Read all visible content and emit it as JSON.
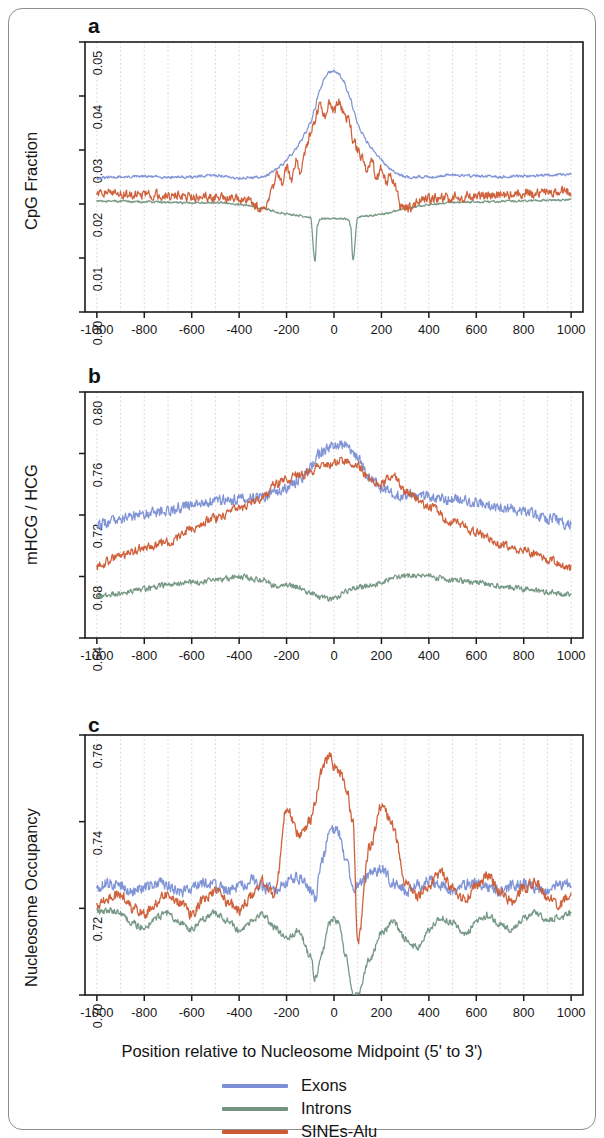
{
  "figure": {
    "border_color": "#8e8e8e",
    "background": "#ffffff"
  },
  "colors": {
    "exons": "#7a8fd4",
    "introns": "#71937f",
    "sines_alu": "#cc5a33",
    "axis": "#1a1a1a",
    "grid": "#c9c9c9"
  },
  "xaxis": {
    "title": "Position relative to Nucleosome Midpoint (5' to 3')",
    "ticks": [
      -1000,
      -800,
      -600,
      -400,
      -200,
      0,
      200,
      400,
      600,
      800,
      1000
    ],
    "tick_labels": [
      "-1000",
      "-800",
      "-600",
      "-400",
      "-200",
      "0",
      "200",
      "400",
      "600",
      "800",
      "1000"
    ],
    "min": -1050,
    "max": 1050
  },
  "legend": {
    "position": "bottom-center",
    "items": [
      {
        "label": "Exons",
        "color": "#7a8fd4",
        "key": "exons"
      },
      {
        "label": "Introns",
        "color": "#71937f",
        "key": "introns"
      },
      {
        "label": "SINEs-Alu",
        "color": "#cc5a33",
        "key": "sines_alu"
      }
    ]
  },
  "panels": [
    {
      "letter": "a",
      "ylabel": "CpG Fraction",
      "ytick_labels": [
        "0.00",
        "0.01",
        "0.02",
        "0.03",
        "0.04",
        "0.05"
      ],
      "yticks": [
        0.0,
        0.01,
        0.02,
        0.03,
        0.04,
        0.05
      ],
      "ylim": [
        0.0,
        0.05
      ]
    },
    {
      "letter": "b",
      "ylabel": "mHCG / HCG",
      "ytick_labels": [
        "0.64",
        "0.68",
        "0.72",
        "0.76",
        "0.80"
      ],
      "yticks": [
        0.64,
        0.68,
        0.72,
        0.76,
        0.8
      ],
      "ylim": [
        0.64,
        0.8
      ]
    },
    {
      "letter": "c",
      "ylabel": "Nucleosome Occupancy",
      "ytick_labels": [
        "0.70",
        "0.72",
        "0.74",
        "0.76"
      ],
      "yticks": [
        0.7,
        0.72,
        0.74,
        0.76
      ],
      "ylim": [
        0.7,
        0.76
      ]
    }
  ],
  "chart_data": [
    {
      "type": "line",
      "panel": "a",
      "title": "CpG Fraction",
      "xlabel": "Position relative to Nucleosome Midpoint (5' to 3')",
      "ylabel": "CpG Fraction",
      "xlim": [
        -1050,
        1050
      ],
      "ylim": [
        0.0,
        0.05
      ],
      "grid": true,
      "x": [
        -1000,
        -900,
        -800,
        -700,
        -600,
        -500,
        -400,
        -300,
        -280,
        -260,
        -240,
        -220,
        -200,
        -180,
        -160,
        -140,
        -120,
        -100,
        -80,
        -70,
        -60,
        -40,
        -20,
        0,
        20,
        40,
        60,
        70,
        80,
        100,
        120,
        140,
        160,
        180,
        200,
        220,
        240,
        260,
        280,
        300,
        400,
        500,
        600,
        700,
        800,
        900,
        1000
      ],
      "series": [
        {
          "name": "Exons",
          "color": "#7a8fd4",
          "values": [
            0.0248,
            0.025,
            0.0251,
            0.025,
            0.025,
            0.0253,
            0.0248,
            0.025,
            0.0254,
            0.0259,
            0.0265,
            0.0272,
            0.0281,
            0.0292,
            0.0303,
            0.0316,
            0.0331,
            0.035,
            0.0378,
            0.0396,
            0.0411,
            0.0432,
            0.0444,
            0.0447,
            0.044,
            0.0428,
            0.0406,
            0.0394,
            0.0377,
            0.0349,
            0.033,
            0.0315,
            0.0302,
            0.0291,
            0.0281,
            0.0272,
            0.0265,
            0.0259,
            0.0254,
            0.025,
            0.025,
            0.0254,
            0.0252,
            0.025,
            0.0252,
            0.0253,
            0.0255
          ]
        },
        {
          "name": "Introns",
          "color": "#71937f",
          "values": [
            0.0205,
            0.0205,
            0.0204,
            0.0203,
            0.0202,
            0.0203,
            0.0199,
            0.0192,
            0.019,
            0.0187,
            0.0185,
            0.0183,
            0.0181,
            0.018,
            0.0179,
            0.0178,
            0.0177,
            0.0176,
            0.0095,
            0.016,
            0.0172,
            0.0173,
            0.0173,
            0.0174,
            0.0173,
            0.0173,
            0.0172,
            0.016,
            0.0095,
            0.0176,
            0.0177,
            0.0178,
            0.0179,
            0.018,
            0.0181,
            0.0183,
            0.0185,
            0.0187,
            0.019,
            0.0192,
            0.0199,
            0.0203,
            0.0204,
            0.0205,
            0.0206,
            0.0207,
            0.0208
          ]
        },
        {
          "name": "SINEs-Alu",
          "color": "#cc5a33",
          "values": [
            0.0219,
            0.0219,
            0.0218,
            0.0216,
            0.0214,
            0.0213,
            0.021,
            0.0192,
            0.0196,
            0.023,
            0.0252,
            0.024,
            0.0268,
            0.0245,
            0.028,
            0.026,
            0.03,
            0.033,
            0.0355,
            0.037,
            0.0382,
            0.036,
            0.0388,
            0.037,
            0.0388,
            0.0372,
            0.0355,
            0.034,
            0.032,
            0.03,
            0.0285,
            0.0262,
            0.028,
            0.0248,
            0.0268,
            0.024,
            0.0252,
            0.023,
            0.0196,
            0.0192,
            0.021,
            0.0213,
            0.0214,
            0.0217,
            0.0219,
            0.0221,
            0.0224
          ]
        }
      ]
    },
    {
      "type": "line",
      "panel": "b",
      "title": "mHCG / HCG",
      "xlabel": "Position relative to Nucleosome Midpoint (5' to 3')",
      "ylabel": "mHCG / HCG",
      "xlim": [
        -1050,
        1050
      ],
      "ylim": [
        0.64,
        0.8
      ],
      "grid": true,
      "x": [
        -1000,
        -900,
        -800,
        -700,
        -600,
        -500,
        -400,
        -300,
        -250,
        -200,
        -150,
        -100,
        -50,
        0,
        50,
        100,
        150,
        200,
        250,
        300,
        400,
        500,
        600,
        700,
        800,
        900,
        1000
      ],
      "series": [
        {
          "name": "Exons",
          "color": "#7a8fd4",
          "values": [
            0.713,
            0.718,
            0.721,
            0.723,
            0.7265,
            0.729,
            0.7305,
            0.732,
            0.7345,
            0.737,
            0.742,
            0.75,
            0.762,
            0.765,
            0.7655,
            0.757,
            0.744,
            0.738,
            0.734,
            0.733,
            0.732,
            0.73,
            0.728,
            0.725,
            0.722,
            0.718,
            0.714
          ]
        },
        {
          "name": "Introns",
          "color": "#71937f",
          "values": [
            0.667,
            0.669,
            0.672,
            0.6745,
            0.676,
            0.6775,
            0.68,
            0.6775,
            0.674,
            0.6745,
            0.673,
            0.669,
            0.666,
            0.6655,
            0.67,
            0.673,
            0.6745,
            0.676,
            0.679,
            0.6805,
            0.68,
            0.6775,
            0.676,
            0.674,
            0.672,
            0.67,
            0.668
          ]
        },
        {
          "name": "SINEs-Alu",
          "color": "#cc5a33",
          "values": [
            0.687,
            0.693,
            0.6985,
            0.702,
            0.711,
            0.718,
            0.724,
            0.731,
            0.74,
            0.743,
            0.746,
            0.748,
            0.753,
            0.754,
            0.756,
            0.752,
            0.743,
            0.74,
            0.747,
            0.735,
            0.725,
            0.716,
            0.709,
            0.701,
            0.697,
            0.691,
            0.6855
          ]
        }
      ]
    },
    {
      "type": "line",
      "panel": "c",
      "title": "Nucleosome Occupancy",
      "xlabel": "Position relative to Nucleosome Midpoint (5' to 3')",
      "ylabel": "Nucleosome Occupancy",
      "xlim": [
        -1050,
        1050
      ],
      "ylim": [
        0.7,
        0.76
      ],
      "grid": true,
      "note": "All three series show ~190 bp periodic oscillation; SINEs-Alu has strongest central peak (~0.755 near -20), Introns dips to <0.70 near +80.",
      "x": [
        -1000,
        -950,
        -900,
        -850,
        -800,
        -750,
        -700,
        -650,
        -600,
        -550,
        -500,
        -450,
        -400,
        -350,
        -300,
        -250,
        -200,
        -150,
        -100,
        -80,
        -50,
        -20,
        0,
        20,
        50,
        80,
        100,
        150,
        200,
        250,
        300,
        350,
        400,
        450,
        500,
        550,
        600,
        650,
        700,
        750,
        800,
        850,
        900,
        950,
        1000
      ],
      "series": [
        {
          "name": "Exons",
          "color": "#7a8fd4",
          "values": [
            0.725,
            0.7258,
            0.7255,
            0.724,
            0.7248,
            0.7258,
            0.7252,
            0.7238,
            0.725,
            0.726,
            0.7252,
            0.724,
            0.7252,
            0.7262,
            0.7248,
            0.724,
            0.7262,
            0.727,
            0.7245,
            0.7225,
            0.731,
            0.7375,
            0.7382,
            0.737,
            0.732,
            0.724,
            0.7255,
            0.7275,
            0.729,
            0.7262,
            0.724,
            0.725,
            0.7262,
            0.7252,
            0.724,
            0.7252,
            0.726,
            0.725,
            0.724,
            0.7252,
            0.7258,
            0.7248,
            0.7242,
            0.7252,
            0.7258
          ]
        },
        {
          "name": "Introns",
          "color": "#71937f",
          "values": [
            0.719,
            0.7196,
            0.7188,
            0.7165,
            0.7155,
            0.7178,
            0.7188,
            0.7168,
            0.7152,
            0.7175,
            0.719,
            0.7172,
            0.7148,
            0.717,
            0.7188,
            0.7155,
            0.7128,
            0.715,
            0.709,
            0.704,
            0.71,
            0.7165,
            0.7178,
            0.7165,
            0.709,
            0.7005,
            0.7,
            0.708,
            0.7145,
            0.7168,
            0.7132,
            0.711,
            0.7148,
            0.718,
            0.7165,
            0.714,
            0.7168,
            0.7185,
            0.7165,
            0.715,
            0.7178,
            0.719,
            0.7172,
            0.718,
            0.7188
          ]
        },
        {
          "name": "SINEs-Alu",
          "color": "#cc5a33",
          "values": [
            0.721,
            0.7225,
            0.7232,
            0.72,
            0.719,
            0.7215,
            0.7235,
            0.7212,
            0.7188,
            0.7218,
            0.724,
            0.7215,
            0.7192,
            0.7228,
            0.7262,
            0.723,
            0.743,
            0.737,
            0.74,
            0.745,
            0.752,
            0.7552,
            0.753,
            0.752,
            0.748,
            0.74,
            0.712,
            0.734,
            0.7435,
            0.739,
            0.726,
            0.7225,
            0.725,
            0.7282,
            0.7245,
            0.7218,
            0.7252,
            0.7275,
            0.724,
            0.7215,
            0.7248,
            0.7262,
            0.7225,
            0.721,
            0.7228
          ]
        }
      ]
    }
  ]
}
